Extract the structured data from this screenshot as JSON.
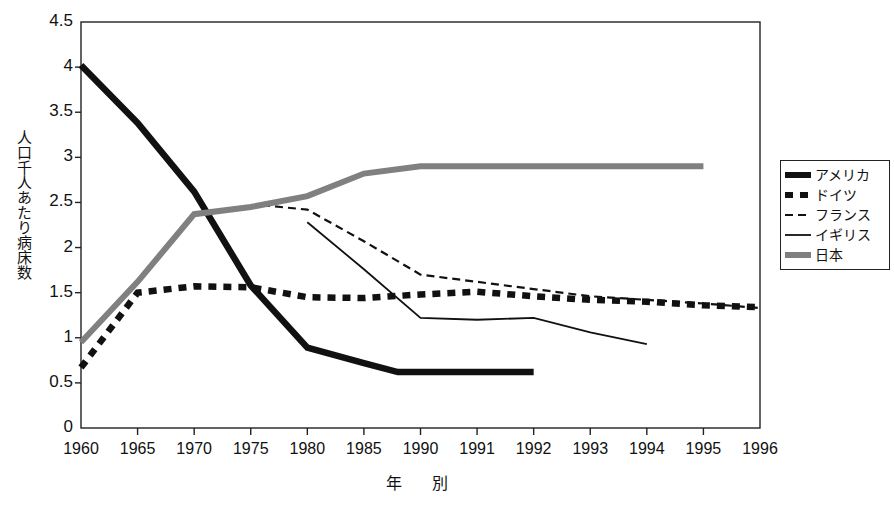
{
  "chart_data": {
    "type": "line",
    "title": "",
    "xlabel": "年　別",
    "ylabel": "人口千人あたり病床数",
    "grid": false,
    "legend_position": "right",
    "xlim": [
      1960,
      1996
    ],
    "ylim": [
      0,
      4.5
    ],
    "yticks": [
      "0",
      "0.5",
      "1",
      "1.5",
      "2",
      "2.5",
      "3",
      "3.5",
      "4",
      "4.5"
    ],
    "ytick_values": [
      0,
      0.5,
      1,
      1.5,
      2,
      2.5,
      3,
      3.5,
      4,
      4.5
    ],
    "categories": [
      "1960",
      "1965",
      "1970",
      "1975",
      "1980",
      "1985",
      "1990",
      "1991",
      "1992",
      "1993",
      "1994",
      "1995",
      "1996"
    ],
    "category_values": [
      1960,
      1965,
      1970,
      1975,
      1980,
      1985,
      1990,
      1991,
      1992,
      1993,
      1994,
      1995,
      1996
    ],
    "series": [
      {
        "name": "アメリカ",
        "style": "thick-solid-black",
        "color": "#111111",
        "x": [
          1960,
          1965,
          1970,
          1975,
          1980,
          1985,
          1988,
          1990,
          1991,
          1992
        ],
        "values": [
          4.02,
          3.38,
          2.62,
          1.58,
          0.89,
          0.72,
          0.62,
          0.62,
          0.62,
          0.62
        ]
      },
      {
        "name": "ドイツ",
        "style": "thick-dotted-black",
        "color": "#111111",
        "x": [
          1960,
          1965,
          1970,
          1975,
          1980,
          1985,
          1990,
          1991,
          1992,
          1993,
          1994,
          1995,
          1996
        ],
        "values": [
          0.67,
          1.5,
          1.57,
          1.56,
          1.45,
          1.44,
          1.48,
          1.51,
          1.46,
          1.42,
          1.4,
          1.36,
          1.34
        ]
      },
      {
        "name": "フランス",
        "style": "thin-dashed-black",
        "color": "#111111",
        "x": [
          1976,
          1980,
          1985,
          1990,
          1991,
          1992,
          1993,
          1994,
          1995,
          1996
        ],
        "values": [
          2.47,
          2.42,
          2.07,
          1.7,
          1.62,
          1.54,
          1.46,
          1.42,
          1.38,
          1.33
        ]
      },
      {
        "name": "イギリス",
        "style": "thin-solid-black",
        "color": "#111111",
        "x": [
          1980,
          1985,
          1990,
          1991,
          1992,
          1993,
          1994
        ],
        "values": [
          2.28,
          1.76,
          1.22,
          1.2,
          1.22,
          1.06,
          0.93
        ]
      },
      {
        "name": "日本",
        "style": "thick-solid-gray",
        "color": "#808080",
        "x": [
          1960,
          1965,
          1970,
          1975,
          1980,
          1985,
          1990,
          1991,
          1992,
          1993,
          1994,
          1995
        ],
        "values": [
          0.95,
          1.62,
          2.37,
          2.45,
          2.57,
          2.82,
          2.9,
          2.9,
          2.9,
          2.9,
          2.9,
          2.9
        ]
      }
    ]
  },
  "axes": {
    "y_title": "人口千人あたり病床数",
    "x_title": "年　別"
  },
  "legend": {
    "items": [
      {
        "label": "アメリカ",
        "style": "thick-solid-black"
      },
      {
        "label": "ドイツ",
        "style": "thick-dotted-black"
      },
      {
        "label": "フランス",
        "style": "thin-dashed-black"
      },
      {
        "label": "イギリス",
        "style": "thin-solid-black"
      },
      {
        "label": "日本",
        "style": "thick-solid-gray"
      }
    ]
  },
  "colors": {
    "foreground": "#111111",
    "japan_gray": "#808080",
    "frame": "#222222",
    "background": "#ffffff"
  }
}
